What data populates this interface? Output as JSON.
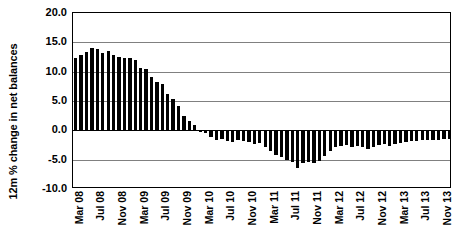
{
  "chart_data": {
    "type": "bar",
    "title": "",
    "subtitle": "",
    "xlabel": "",
    "ylabel": "12m % change in net balances",
    "ylim": [
      -10.0,
      20.0
    ],
    "ytick_labels": [
      "20.0",
      "15.0",
      "10.0",
      "5.0",
      "0.0",
      "-5.0",
      "-10.0"
    ],
    "yticks": [
      20.0,
      15.0,
      10.0,
      5.0,
      0.0,
      -5.0,
      -10.0
    ],
    "grid": true,
    "legend": "none",
    "bar_color": "#000000",
    "xtick_labels": [
      "Mar 08",
      "Jul 08",
      "Nov 08",
      "Mar 09",
      "Jul 09",
      "Nov 09",
      "Mar 10",
      "Jul 10",
      "Nov 10",
      "Mar 11",
      "Jul 11",
      "Nov 11",
      "Mar 12",
      "Jul 12",
      "Nov 12",
      "Mar 13",
      "Jul 13",
      "Nov 13"
    ],
    "xtick_indices": [
      0,
      4,
      8,
      12,
      16,
      20,
      24,
      28,
      32,
      36,
      40,
      44,
      48,
      52,
      56,
      60,
      64,
      68
    ],
    "categories": [
      "Mar 08",
      "Apr 08",
      "May 08",
      "Jun 08",
      "Jul 08",
      "Aug 08",
      "Sep 08",
      "Oct 08",
      "Nov 08",
      "Dec 08",
      "Jan 09",
      "Feb 09",
      "Mar 09",
      "Apr 09",
      "May 09",
      "Jun 09",
      "Jul 09",
      "Aug 09",
      "Sep 09",
      "Oct 09",
      "Nov 09",
      "Dec 09",
      "Jan 10",
      "Feb 10",
      "Mar 10",
      "Apr 10",
      "May 10",
      "Jun 10",
      "Jul 10",
      "Aug 10",
      "Sep 10",
      "Oct 10",
      "Nov 10",
      "Dec 10",
      "Jan 11",
      "Feb 11",
      "Mar 11",
      "Apr 11",
      "May 11",
      "Jun 11",
      "Jul 11",
      "Aug 11",
      "Sep 11",
      "Oct 11",
      "Nov 11",
      "Dec 11",
      "Jan 12",
      "Feb 12",
      "Mar 12",
      "Apr 12",
      "May 12",
      "Jun 12",
      "Jul 12",
      "Aug 12",
      "Sep 12",
      "Oct 12",
      "Nov 12",
      "Dec 12",
      "Jan 13",
      "Feb 13",
      "Mar 13",
      "Apr 13",
      "May 13",
      "Jun 13",
      "Jul 13",
      "Aug 13",
      "Sep 13",
      "Oct 13",
      "Nov 13",
      "Dec 13"
    ],
    "values": [
      12.3,
      12.8,
      13.3,
      14.0,
      13.8,
      13.1,
      13.6,
      12.9,
      12.5,
      12.4,
      12.3,
      12.0,
      10.6,
      10.4,
      9.1,
      8.3,
      7.9,
      6.2,
      5.3,
      4.2,
      2.4,
      1.6,
      0.9,
      -0.2,
      -0.4,
      -1.2,
      -1.6,
      -1.5,
      -1.8,
      -2.0,
      -1.7,
      -1.9,
      -2.0,
      -2.3,
      -2.1,
      -2.8,
      -3.5,
      -4.2,
      -4.5,
      -5.0,
      -5.4,
      -6.5,
      -5.6,
      -5.4,
      -5.5,
      -5.3,
      -4.4,
      -3.5,
      -2.9,
      -2.6,
      -2.5,
      -2.8,
      -2.6,
      -2.9,
      -3.2,
      -2.8,
      -2.5,
      -2.4,
      -2.6,
      -2.4,
      -2.2,
      -2.0,
      -1.9,
      -1.8,
      -1.7,
      -1.6,
      -1.7,
      -1.6,
      -1.5,
      -1.5
    ]
  }
}
